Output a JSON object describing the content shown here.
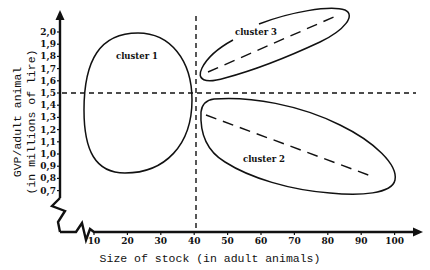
{
  "chart_data": {
    "type": "scatter",
    "title": "",
    "xlabel": "Size of stock (in adult animals)",
    "ylabel": "GVP/adult animal",
    "ylabel_sub": "(in millions of lire)",
    "x_ticks": [
      "10",
      "20",
      "30",
      "40",
      "50",
      "60",
      "70",
      "80",
      "90",
      "100"
    ],
    "y_ticks": [
      "0,7",
      "0,8",
      "0,9",
      "1,0",
      "1,1",
      "1,2",
      "1,3",
      "1,4",
      "1,5",
      "1,6",
      "1,7",
      "1,8",
      "1,9",
      "2,0"
    ],
    "xlim": [
      5,
      108
    ],
    "ylim": [
      0.65,
      2.1
    ],
    "axis_breaks": true,
    "grid": false,
    "reference_lines": {
      "vertical_x": 40,
      "horizontal_y": 1.5,
      "style": "dashed"
    },
    "clusters": [
      {
        "name": "cluster 1",
        "shape": "ellipse",
        "x_range": [
          7,
          39
        ],
        "y_range": [
          0.88,
          2.06
        ],
        "center": [
          23,
          1.48
        ],
        "trend_line": null
      },
      {
        "name": "cluster 2",
        "shape": "ellipse",
        "x_range": [
          41,
          100
        ],
        "y_range": [
          0.72,
          1.35
        ],
        "trend_line": {
          "from": [
            42,
            1.33
          ],
          "to": [
            92,
            0.83
          ],
          "style": "dashed",
          "direction": "negative"
        }
      },
      {
        "name": "cluster 3",
        "shape": "ellipse",
        "x_range": [
          42,
          87
        ],
        "y_range": [
          1.6,
          2.14
        ],
        "trend_line": {
          "from": [
            44,
            1.65
          ],
          "to": [
            82,
            2.08
          ],
          "style": "dashed",
          "direction": "positive"
        }
      }
    ]
  }
}
